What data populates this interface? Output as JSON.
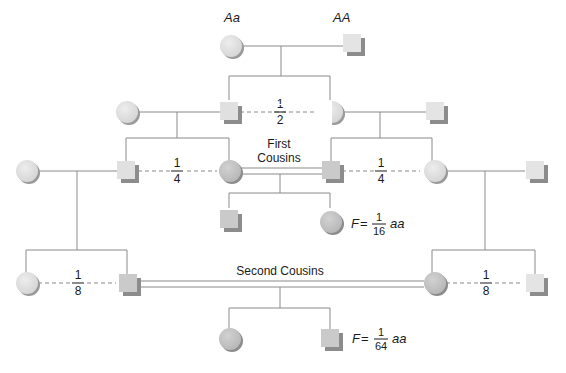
{
  "colors": {
    "line": "#8a8a8a",
    "light_fill": "#e4e4e4",
    "dark_fill": "#c8c8c8",
    "shadow": "#8c8c8c",
    "text": "#1a1a1a"
  },
  "founders": {
    "mother_genotype": "Aa",
    "father_genotype": "AA"
  },
  "probabilities": {
    "gen2": {
      "num": "1",
      "den": "2"
    },
    "gen3_left": {
      "num": "1",
      "den": "4"
    },
    "gen3_right": {
      "num": "1",
      "den": "4"
    },
    "gen4_left": {
      "num": "1",
      "den": "8"
    },
    "gen4_right": {
      "num": "1",
      "den": "8"
    }
  },
  "labels": {
    "first_cousins_line1": "First",
    "first_cousins_line2": "Cousins",
    "second_cousins": "Second Cousins"
  },
  "first_cousin_offspring": {
    "f_label": "F",
    "equals": "=",
    "num": "1",
    "den": "16",
    "genotype": "aa"
  },
  "second_cousin_offspring": {
    "f_label": "F",
    "equals": "=",
    "num": "1",
    "den": "64",
    "genotype": "aa"
  }
}
